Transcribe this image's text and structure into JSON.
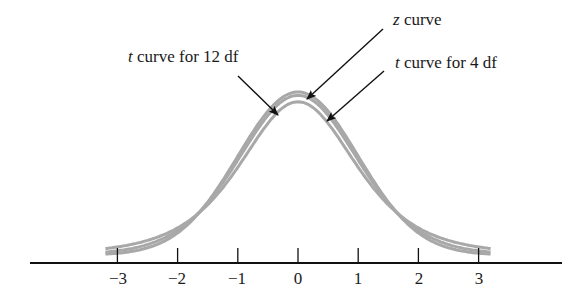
{
  "chart_data": {
    "type": "line",
    "title": "",
    "xlabel": "",
    "ylabel": "",
    "x_ticks": [
      "−3",
      "−2",
      "−1",
      "0",
      "1",
      "2",
      "3"
    ],
    "xlim": [
      -3.3,
      3.3
    ],
    "grid": false,
    "series": [
      {
        "name": "z curve",
        "distribution": "standard normal",
        "peak_density": 0.399
      },
      {
        "name": "t curve for 12 df",
        "distribution": "t",
        "df": 12,
        "peak_density": 0.391
      },
      {
        "name": "t curve for 4 df",
        "distribution": "t",
        "df": 4,
        "peak_density": 0.375
      }
    ],
    "annotations": [
      {
        "var": "z",
        "text": " curve",
        "target": "z curve"
      },
      {
        "var": "t",
        "text": " curve for 12 df",
        "target": "t curve for 12 df"
      },
      {
        "var": "t",
        "text": " curve for 4 df",
        "target": "t curve for 4 df"
      }
    ]
  },
  "style": {
    "curve_color": "#a8a8a8",
    "axis_color": "#111111",
    "arrow_color": "#111111"
  }
}
